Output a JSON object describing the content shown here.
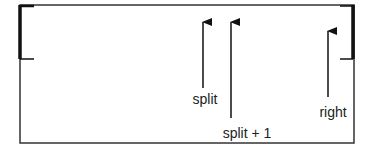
{
  "diagram": {
    "type": "array-partition",
    "colors": {
      "stroke": "#333333",
      "bracket": "#111111",
      "text": "#222222",
      "background": "#ffffff"
    },
    "box": {
      "x": 20,
      "y": 5,
      "width": 334,
      "height": 138
    },
    "brackets": [
      {
        "id": "left-bracket",
        "side": "left",
        "x": 20,
        "y_top": 5,
        "y_bottom": 59,
        "tick_to_x": 34
      },
      {
        "id": "right-bracket",
        "side": "right",
        "x": 353,
        "y_top": 5,
        "y_bottom": 59,
        "tick_to_x": 340
      }
    ],
    "pointers": [
      {
        "id": "split",
        "label": "split",
        "x": 203,
        "head_y": 22,
        "tail_y": 88,
        "label_x": 205,
        "label_y": 104
      },
      {
        "id": "split-plus-1",
        "label": "split + 1",
        "x": 231,
        "head_y": 22,
        "tail_y": 118,
        "label_x": 247,
        "label_y": 138
      },
      {
        "id": "right",
        "label": "right",
        "x": 328,
        "head_y": 31,
        "tail_y": 97,
        "label_x": 333,
        "label_y": 117
      }
    ]
  }
}
